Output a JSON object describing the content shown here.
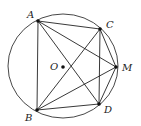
{
  "diagram": {
    "type": "circle-geometry",
    "circle": {
      "center_label": "O",
      "cx": 63,
      "cy": 66,
      "rx": 55,
      "ry": 52
    },
    "points": [
      {
        "id": "A",
        "label": "A",
        "x": 38,
        "y": 21,
        "lx": 27,
        "ly": 18
      },
      {
        "id": "B",
        "label": "B",
        "x": 37,
        "y": 110,
        "lx": 25,
        "ly": 121
      },
      {
        "id": "C",
        "label": "C",
        "x": 100,
        "y": 29,
        "lx": 106,
        "ly": 28
      },
      {
        "id": "M",
        "label": "M",
        "x": 116,
        "y": 67,
        "lx": 122,
        "ly": 71
      },
      {
        "id": "D",
        "label": "D",
        "x": 99,
        "y": 104,
        "lx": 104,
        "ly": 113
      },
      {
        "id": "O",
        "label": "O",
        "x": 63,
        "y": 67,
        "lx": 50,
        "ly": 70
      }
    ],
    "segments": [
      [
        "A",
        "B"
      ],
      [
        "A",
        "C"
      ],
      [
        "A",
        "M"
      ],
      [
        "A",
        "D"
      ],
      [
        "B",
        "C"
      ],
      [
        "B",
        "M"
      ],
      [
        "B",
        "D"
      ],
      [
        "C",
        "D"
      ],
      [
        "C",
        "M"
      ],
      [
        "M",
        "D"
      ]
    ]
  }
}
